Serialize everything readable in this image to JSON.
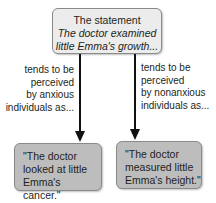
{
  "top_box": {
    "line1": "The statement",
    "line2": "The doctor examined",
    "line3": "little Emma's growth..."
  },
  "left_label": {
    "line1": "tends to be",
    "line2": "perceived",
    "line3": "by anxious",
    "line4": "individuals as..."
  },
  "right_label": {
    "line1": "tends to be",
    "line2": "perceived",
    "line3": "by nonanxious",
    "line4": "individuals as..."
  },
  "left_box": {
    "line1": "\"The doctor",
    "line2": "looked at little",
    "line3": "Emma's cancer.\""
  },
  "right_box": {
    "line1": "\"The doctor",
    "line2": "measured little",
    "line3": "Emma's height.\""
  },
  "colors": {
    "top_box_fill": "#ececec",
    "bottom_box_fill": "#bdbdbd",
    "arrow": "#111111"
  }
}
